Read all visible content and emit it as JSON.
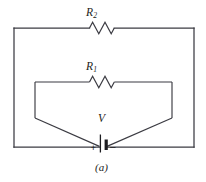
{
  "figure": {
    "caption": "(a)",
    "kind": "circuit-diagram",
    "line_color": "#3b3b42",
    "background_color": "#ffffff"
  },
  "components": {
    "resistor_outer": {
      "label_main": "R",
      "label_subscript": "2",
      "symbol": "zigzag-resistor",
      "location": "outer-loop-top"
    },
    "resistor_inner": {
      "label_main": "R",
      "label_subscript": "1",
      "symbol": "zigzag-resistor",
      "location": "inner-loop-top"
    },
    "source": {
      "label": "V",
      "symbol": "battery-cell",
      "positive_terminal": "+",
      "negative_terminal": "–",
      "location": "bottom-center"
    }
  },
  "geometry": {
    "outer_loop": {
      "left": 14,
      "right": 194,
      "top": 28,
      "bottom": 147
    },
    "inner_loop": {
      "left": 35,
      "right": 172,
      "top": 82,
      "knee": 118
    },
    "battery_x": 103,
    "resistor_outer_center_x": 103,
    "resistor_outer_y": 28,
    "resistor_inner_center_x": 103,
    "resistor_inner_y": 82
  }
}
